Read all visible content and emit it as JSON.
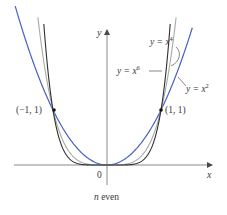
{
  "chart_data": {
    "type": "line",
    "title": "",
    "caption": "n even",
    "xlabel": "x",
    "ylabel": "y",
    "origin_label": "0",
    "xlim": [
      -1.72,
      1.95
    ],
    "ylim": [
      -0.35,
      2.45
    ],
    "grid": false,
    "series": [
      {
        "name": "y = x^2",
        "label_base": "y = x",
        "exponent": "2",
        "color": "#4a5fc4",
        "formula": "x^2"
      },
      {
        "name": "y = x^4",
        "label_base": "y = x",
        "exponent": "4",
        "color": "#a9a9a2",
        "formula": "x^4"
      },
      {
        "name": "y = x^6",
        "label_base": "y = x",
        "exponent": "6",
        "color": "#2f2f2f",
        "formula": "x^6"
      }
    ],
    "annotations": [
      {
        "text": "(−1, 1)",
        "x": -1,
        "y": 1
      },
      {
        "text": "(1, 1)",
        "x": 1,
        "y": 1
      }
    ]
  }
}
